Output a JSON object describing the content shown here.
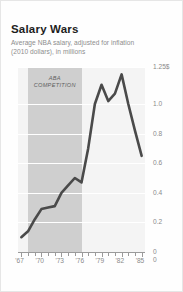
{
  "card": {
    "title": "Salary Wars",
    "subtitle_line1": "Average NBA salary, adjusted for inflation",
    "subtitle_line2": "(2010 dollars), in millions"
  },
  "annotation": {
    "aba_label_line1": "ABA",
    "aba_label_line2": "COMPETITION",
    "aba_start_year": 1968,
    "aba_end_year": 1976
  },
  "colors": {
    "line": "#4a4a4a",
    "plot_background": "#f4f4f4",
    "shaded_band": "#cfcfcf",
    "gridline": "#ffffff",
    "axis": "#9a9a9a",
    "tick_label": "#8a8a8a",
    "title": "#1d1d1d",
    "subtitle": "#8d8d8d",
    "card_border": "#e6e6e6"
  },
  "chart_data": {
    "type": "line",
    "title": "Salary Wars",
    "subtitle": "Average NBA salary, adjusted for inflation (2010 dollars), in millions",
    "xlabel": "",
    "ylabel": "",
    "xlim": [
      1966.5,
      1985.5
    ],
    "ylim": [
      0,
      1.25
    ],
    "yticks": [
      0,
      0.2,
      0.4,
      0.6,
      0.8,
      1.0,
      1.25
    ],
    "ytick_labels": [
      "0",
      "0.2",
      "0.4",
      "0.6",
      "0.8",
      "1.0",
      "1.25$"
    ],
    "xticks": [
      1967,
      1970,
      1973,
      1976,
      1979,
      1982,
      1985
    ],
    "xtick_labels": [
      "'67",
      "'70",
      "'73",
      "'76",
      "'79",
      "'82",
      "'85"
    ],
    "grid": "horizontal",
    "legend": "none",
    "annotations": [
      {
        "text": "ABA COMPETITION",
        "type": "shaded-band",
        "x_start": 1968,
        "x_end": 1976
      }
    ],
    "series": [
      {
        "name": "Average NBA salary",
        "x": [
          1967,
          1968,
          1969,
          1970,
          1971,
          1972,
          1973,
          1974,
          1975,
          1976,
          1977,
          1978,
          1979,
          1980,
          1981,
          1982,
          1983,
          1984,
          1985
        ],
        "values": [
          0.1,
          0.14,
          0.22,
          0.29,
          0.3,
          0.31,
          0.4,
          0.45,
          0.5,
          0.47,
          0.7,
          1.0,
          1.13,
          1.02,
          1.07,
          1.2,
          1.0,
          0.82,
          0.65
        ]
      }
    ]
  }
}
